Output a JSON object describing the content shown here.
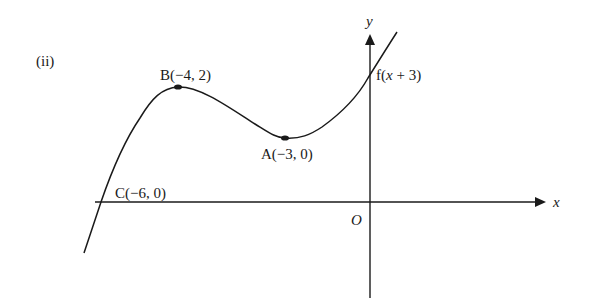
{
  "figure": {
    "part_label": "(ii)",
    "axes": {
      "x_label": "x",
      "y_label": "y",
      "origin_label": "O"
    },
    "curve_label": "f(x + 3)",
    "points": [
      {
        "name": "B",
        "label": "B(−4, 2)",
        "x": -4,
        "y": 2,
        "type": "maximum"
      },
      {
        "name": "A",
        "label": "A(−3, 0)",
        "x": -3,
        "y": 0,
        "type": "minimum"
      },
      {
        "name": "C",
        "label": "C(−6, 0)",
        "x": -6,
        "y": 0,
        "type": "x-intercept"
      }
    ],
    "colors": {
      "line": "#1a1a1a",
      "background": "#ffffff"
    }
  }
}
